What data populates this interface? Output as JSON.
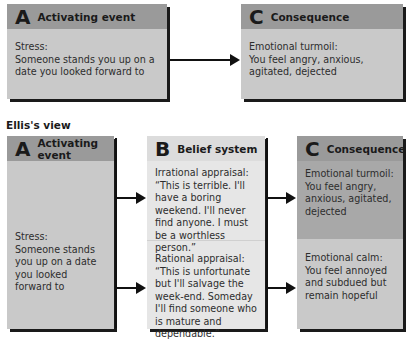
{
  "traditional_view": {
    "activating_event": {
      "letter": "A",
      "title": "Activating event",
      "text_line1": "Stress:",
      "text_line2": "Someone stands you up on a date you looked forward to"
    },
    "consequence": {
      "letter": "C",
      "title": "Consequence",
      "text_line1": "Emotional turmoil:",
      "text_line2": "You feel angry, anxious, agitated, dejected"
    }
  },
  "ellis_view": {
    "section_title": "Ellis's view",
    "activating_event": {
      "letter": "A",
      "title": "Activating event",
      "text_line1": "Stress:",
      "text_line2": "Someone stands you up on a date you looked forward to"
    },
    "belief_system": {
      "letter": "B",
      "title": "Belief system",
      "irrational_label": "Irrational appraisal:",
      "irrational_text": "“This is terrible. I'll have a boring weekend. I'll never find anyone. I must be a worthless person.”",
      "rational_label": "Rational appraisal:",
      "rational_text": "“This is unfortunate but I'll salvage the week-end. Someday I'll find someone who is mature and dependable.”"
    },
    "consequence": {
      "letter": "C",
      "title": "Consequence",
      "turmoil_label": "Emotional turmoil:",
      "turmoil_text": "You feel angry, anxious, agitated, dejected",
      "calm_label": "Emotional calm:",
      "calm_text": "You feel annoyed and subdued but remain hopeful"
    }
  },
  "colors": {
    "header_dark": "#9a9a9a",
    "box_fill": "#c9c9c9",
    "belief_fill": "#e6e6e6",
    "arrow": "#111111"
  }
}
